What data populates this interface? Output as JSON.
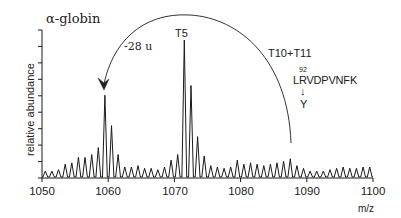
{
  "chart_data": {
    "type": "line",
    "title": "α-globin",
    "xlabel": "m/z",
    "ylabel": "relative abundance",
    "xlim": [
      1050,
      1100
    ],
    "ylim": [
      0,
      100
    ],
    "x_ticks": [
      1050,
      1060,
      1070,
      1080,
      1090,
      1100
    ],
    "y_ticks_labeled": false,
    "grid": false,
    "legend": null,
    "series": [
      {
        "name": "spectrum",
        "x": [
          1050.5,
          1051.5,
          1052.5,
          1053.5,
          1054.5,
          1055.5,
          1056.5,
          1057.5,
          1058.5,
          1059.5,
          1060.5,
          1061.5,
          1062.5,
          1063.5,
          1064.5,
          1065.5,
          1066.5,
          1067.5,
          1068.5,
          1069.5,
          1070.5,
          1071.5,
          1072.5,
          1073.5,
          1074.5,
          1075.5,
          1076.5,
          1077.5,
          1078.5,
          1079.5,
          1080.5,
          1081.5,
          1082.5,
          1083.5,
          1084.5,
          1085.5,
          1086.5,
          1087.5,
          1088.5,
          1089.5,
          1090.5,
          1091.5,
          1092.5,
          1093.5,
          1094.5,
          1095.5,
          1096.5,
          1097.5,
          1098.5,
          1099.5
        ],
        "values": [
          5,
          5,
          6,
          10,
          11,
          15,
          15,
          17,
          22,
          60,
          38,
          17,
          8,
          8,
          9,
          7,
          7,
          6,
          8,
          13,
          17,
          100,
          67,
          30,
          16,
          9,
          8,
          7,
          8,
          13,
          10,
          11,
          10,
          9,
          10,
          11,
          12,
          14,
          9,
          7,
          5,
          5,
          5,
          6,
          7,
          8,
          7,
          7,
          8,
          8
        ]
      }
    ],
    "annotations": [
      {
        "text": "T5",
        "x": 1071.5
      },
      {
        "text": "-28 u",
        "type": "curved-arrow",
        "from_x": 1087.5,
        "to_x": 1059.5
      },
      {
        "text": "T10+T11",
        "x": 1088
      },
      {
        "text": "92",
        "role": "residue-number"
      },
      {
        "text": "LRVDPVNFK",
        "role": "sequence"
      },
      {
        "text": "↓",
        "role": "mutation-arrow"
      },
      {
        "text": "Y",
        "role": "substitution"
      }
    ]
  },
  "labels": {
    "title": "α-globin",
    "shift": "-28 u",
    "t5": "T5",
    "t10": "T10+T11",
    "res_num": "92",
    "sequence": "LRVDPVNFK",
    "mut_arrow": "↓",
    "mutation": "Y",
    "ylabel": "relative abundance",
    "xunit": "m/z",
    "xticks": [
      "1050",
      "1060",
      "1070",
      "1080",
      "1090",
      "1100"
    ]
  },
  "colors": {
    "line": "#1a1a1a",
    "text": "#222222",
    "background": "#ffffff"
  }
}
